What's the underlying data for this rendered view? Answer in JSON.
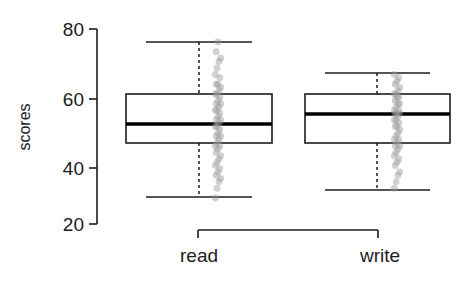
{
  "chart_data": {
    "type": "box",
    "title": "",
    "xlabel": "",
    "ylabel": "scores",
    "categories": [
      "read",
      "write"
    ],
    "ylim": [
      20,
      80
    ],
    "yticks": [
      20,
      40,
      60,
      80
    ],
    "ytick_labels": [
      "20",
      "40",
      "60",
      "80"
    ],
    "grid": false,
    "legend": "none",
    "orientation": "vertical",
    "overlay": "jittered strip of individual data points (gray, semi-transparent)",
    "boxes": [
      {
        "name": "read",
        "whisker_low": 28,
        "q1": 44,
        "median": 50,
        "q3": 60,
        "whisker_high": 76,
        "outliers": []
      },
      {
        "name": "write",
        "whisker_low": 31,
        "q1": 45,
        "median": 54,
        "q3": 60,
        "whisker_high": 66,
        "outliers": []
      }
    ],
    "points": {
      "read": [
        28,
        31,
        33,
        34,
        35,
        36,
        37,
        38,
        39,
        40,
        41,
        42,
        43,
        44,
        44,
        45,
        46,
        47,
        47,
        48,
        49,
        50,
        50,
        51,
        52,
        52,
        53,
        54,
        55,
        55,
        56,
        57,
        57,
        58,
        59,
        60,
        60,
        61,
        62,
        63,
        63,
        65,
        66,
        68,
        70,
        71,
        73,
        76
      ],
      "write": [
        31,
        33,
        35,
        36,
        38,
        39,
        40,
        41,
        42,
        43,
        44,
        44,
        45,
        46,
        46,
        47,
        48,
        49,
        50,
        50,
        51,
        52,
        52,
        53,
        54,
        54,
        54,
        55,
        55,
        56,
        57,
        57,
        58,
        59,
        59,
        60,
        60,
        61,
        62,
        63,
        64,
        65,
        66
      ]
    },
    "colors": {
      "box_line": "#1c1c1c",
      "median_line": "#000000",
      "whisker_line": "#1c1c1c",
      "point_fill": "#9a9a9a",
      "axis": "#1c1c1c",
      "background": "#ffffff"
    }
  },
  "axis": {
    "y_title": "scores",
    "y_labels": [
      "80",
      "60",
      "40",
      "20"
    ],
    "x_labels": [
      "read",
      "write"
    ]
  }
}
